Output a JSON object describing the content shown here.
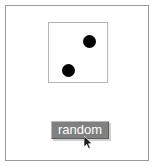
{
  "window": {
    "title": "random",
    "background_color": "#ffffff",
    "border_color": "#9a9a9a"
  },
  "die": {
    "name": "die-face",
    "value": 2,
    "face_color": "#ffffff",
    "border_color": "#b3b3b3",
    "pip_color": "#000000",
    "pip_count": 2,
    "pips": [
      {
        "label": "pip-top-right",
        "left": 34,
        "top": 12
      },
      {
        "label": "pip-bottom-left",
        "left": 13,
        "top": 41
      }
    ]
  },
  "controls": {
    "random_button": {
      "label": "random",
      "background_color": "#808080",
      "text_color": "#ffffff"
    }
  },
  "cursor": {
    "name": "mouse-pointer",
    "x": 82,
    "y": 134
  }
}
